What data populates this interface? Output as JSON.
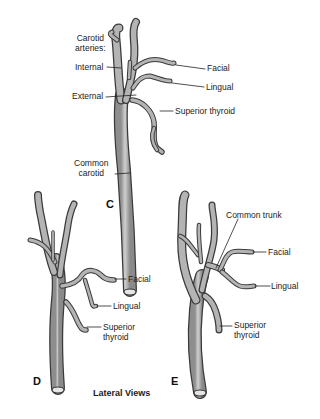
{
  "figure": {
    "caption": "Lateral Views",
    "vessel_color": "#a8a8a8",
    "vessel_outline": "#3a3a3a",
    "panels": [
      {
        "id": "C",
        "letter": "C",
        "labels": {
          "carotid_line1": "Carotid",
          "carotid_line2": "arteries:",
          "internal": "Internal",
          "external": "External",
          "facial": "Facial",
          "lingual": "Lingual",
          "superior_thyroid": "Superior thyroid",
          "common_line1": "Common",
          "common_line2": "carotid"
        }
      },
      {
        "id": "D",
        "letter": "D",
        "labels": {
          "facial": "Facial",
          "lingual": "Lingual",
          "superior_line1": "Superior",
          "superior_line2": "thyroid"
        }
      },
      {
        "id": "E",
        "letter": "E",
        "labels": {
          "common_trunk": "Common trunk",
          "facial": "Facial",
          "lingual": "Lingual",
          "superior_line1": "Superior",
          "superior_line2": "thyroid"
        }
      }
    ]
  }
}
